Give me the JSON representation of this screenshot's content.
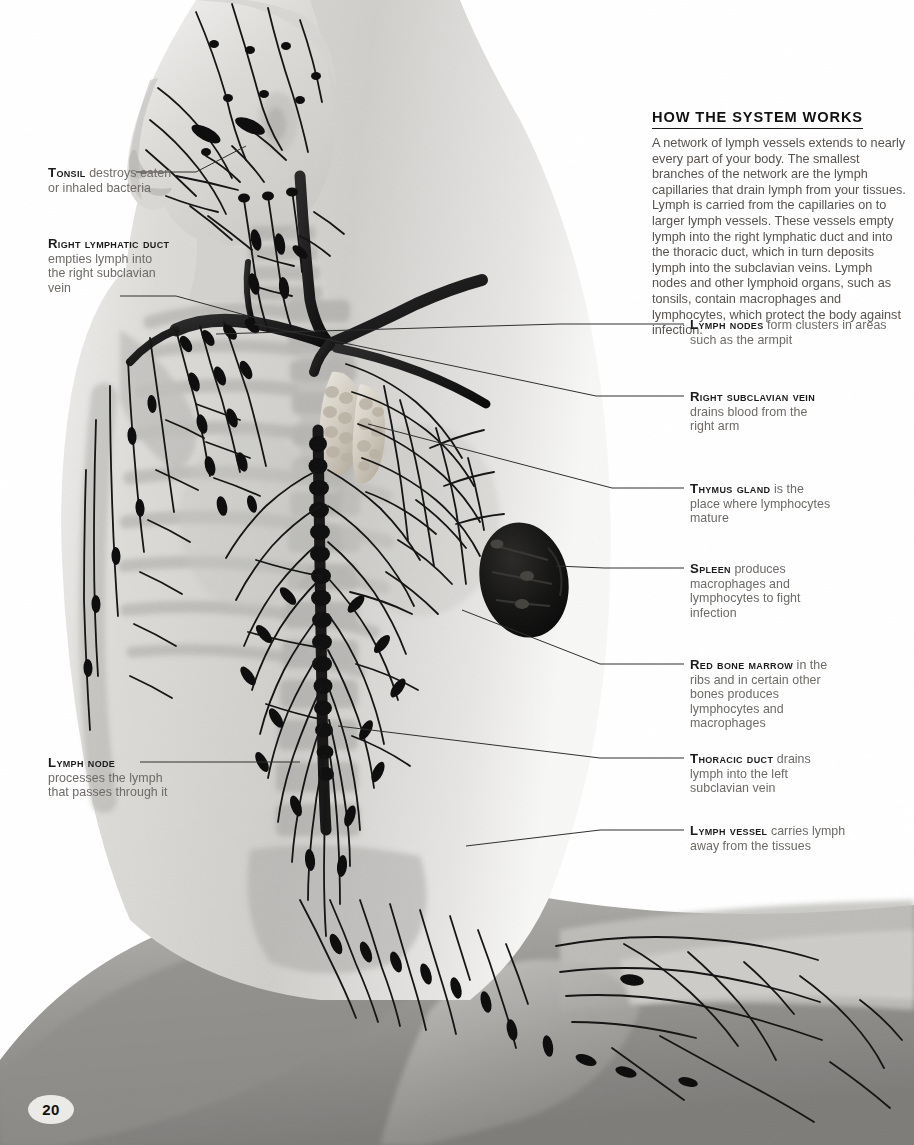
{
  "page": {
    "number": "20",
    "accent_color": "#1a1a1a",
    "body_text_color": "#59534f",
    "term_color": "#1b1b1b",
    "background_color": "#ffffff"
  },
  "panel": {
    "heading": "HOW THE SYSTEM WORKS",
    "body": "A network of lymph vessels extends to nearly every part of your body. The smallest branches of the network are the lymph capillaries that drain lymph from your tissues. Lymph is carried from the capillaries on to larger lymph vessels. These vessels empty lymph into the right lymphatic duct and into the thoracic duct, which in turn deposits lymph into the subclavian veins. Lymph nodes and other lymphoid organs, such as tonsils, contain macrophages and lymphocytes, which protect the body against infection."
  },
  "callouts": [
    {
      "id": "tonsil",
      "term": "Tonsil",
      "description": " destroys eaten or inhaled bacteria",
      "side": "left",
      "x": 48,
      "y": 166,
      "width": 130
    },
    {
      "id": "right-lymphatic-duct",
      "term": "Right lymphatic duct",
      "description": " empties lymph into the right subclavian vein",
      "side": "left",
      "x": 48,
      "y": 237,
      "width": 120
    },
    {
      "id": "lymph-node",
      "term": "Lymph node",
      "description": " processes the lymph that passes through it",
      "side": "left",
      "x": 48,
      "y": 756,
      "width": 120
    },
    {
      "id": "lymph-nodes",
      "term": "Lymph nodes",
      "description": " form clusters in areas such as the armpit",
      "side": "right",
      "x": 690,
      "y": 318,
      "width": 215
    },
    {
      "id": "right-subclavian-vein",
      "term": "Right subclavian vein",
      "description": " drains blood from the right arm",
      "side": "right",
      "x": 690,
      "y": 390,
      "width": 130
    },
    {
      "id": "thymus-gland",
      "term": "Thymus gland",
      "description": " is the place where lymphocytes mature",
      "side": "right",
      "x": 690,
      "y": 482,
      "width": 140
    },
    {
      "id": "spleen",
      "term": "Spleen",
      "description": " produces macrophages and lymphocytes to fight infection",
      "side": "right",
      "x": 690,
      "y": 562,
      "width": 130
    },
    {
      "id": "red-bone-marrow",
      "term": "Red bone marrow",
      "description": " in the ribs and in certain other bones produces lymphocytes and macrophages",
      "side": "right",
      "x": 690,
      "y": 658,
      "width": 150
    },
    {
      "id": "thoracic-duct",
      "term": "Thoracic duct",
      "description": " drains lymph into the left subclavian vein",
      "side": "right",
      "x": 690,
      "y": 752,
      "width": 150
    },
    {
      "id": "lymph-vessel",
      "term": "Lymph vessel",
      "description": " carries lymph away from the tissues",
      "side": "right",
      "x": 690,
      "y": 824,
      "width": 170
    }
  ],
  "figure": {
    "organs": [
      {
        "name": "thymus-gland",
        "cx": 351,
        "cy": 412
      },
      {
        "name": "spleen",
        "cx": 524,
        "cy": 580
      },
      {
        "name": "thoracic-duct",
        "cx": 322,
        "cy": 650
      }
    ]
  }
}
